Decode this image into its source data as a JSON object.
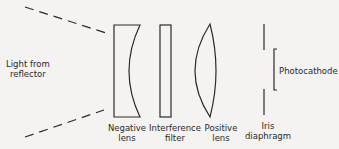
{
  "diagram": {
    "source_label_line1": "Light  from",
    "source_label_line2": "reflector",
    "components": [
      {
        "name": "negative-lens",
        "line1": "Negative",
        "line2": "lens"
      },
      {
        "name": "interference-filter",
        "line1": "Interference",
        "line2": "filter"
      },
      {
        "name": "positive-lens",
        "line1": "Positive",
        "line2": "lens"
      },
      {
        "name": "iris-diaphragm",
        "line1": "Iris",
        "line2": "diaphragm"
      }
    ],
    "detector_label": "Photocathode",
    "colors": {
      "stroke": "#2a2a2a",
      "background": "#f4f3f1"
    }
  }
}
